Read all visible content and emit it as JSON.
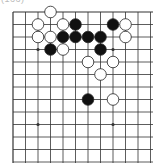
{
  "diagram": {
    "label": "(166)",
    "board": {
      "visible_columns": 12,
      "visible_rows": 13,
      "edges": [
        "top",
        "left"
      ],
      "star_points": [
        [
          2,
          3
        ],
        [
          8,
          3
        ],
        [
          2,
          9
        ],
        [
          8,
          9
        ]
      ],
      "stones": [
        {
          "color": "white",
          "col": 3,
          "row": 0
        },
        {
          "color": "white",
          "col": 2,
          "row": 1
        },
        {
          "color": "white",
          "col": 4,
          "row": 1
        },
        {
          "color": "black",
          "col": 5,
          "row": 1
        },
        {
          "color": "black",
          "col": 8,
          "row": 1
        },
        {
          "color": "white",
          "col": 9,
          "row": 1
        },
        {
          "color": "white",
          "col": 2,
          "row": 2
        },
        {
          "color": "white",
          "col": 3,
          "row": 2
        },
        {
          "color": "black",
          "col": 4,
          "row": 2
        },
        {
          "color": "black",
          "col": 5,
          "row": 2
        },
        {
          "color": "black",
          "col": 6,
          "row": 2
        },
        {
          "color": "black",
          "col": 7,
          "row": 2
        },
        {
          "color": "white",
          "col": 9,
          "row": 2
        },
        {
          "color": "black",
          "col": 3,
          "row": 3
        },
        {
          "color": "white",
          "col": 4,
          "row": 3
        },
        {
          "color": "black",
          "col": 7,
          "row": 3
        },
        {
          "color": "white",
          "col": 6,
          "row": 4
        },
        {
          "color": "white",
          "col": 8,
          "row": 4
        },
        {
          "color": "white",
          "col": 7,
          "row": 5
        },
        {
          "color": "black",
          "col": 6,
          "row": 7
        },
        {
          "color": "white",
          "col": 8,
          "row": 7
        }
      ]
    },
    "colors": {
      "line": "#333333",
      "black_stone": "#111111",
      "white_stone": "#ffffff",
      "stone_outline": "#222222"
    }
  }
}
